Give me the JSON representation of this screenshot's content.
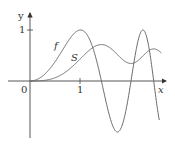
{
  "chart_data": {
    "type": "line",
    "title": "",
    "xlabel": "x",
    "ylabel": "y",
    "x_ticks": [
      {
        "value": 0,
        "label": "0"
      },
      {
        "value": 1,
        "label": "1"
      }
    ],
    "y_ticks": [
      {
        "value": 1,
        "label": "1"
      }
    ],
    "xlim": [
      -0.6,
      2.7
    ],
    "ylim": [
      -1.2,
      1.4
    ],
    "grid": false,
    "legend": "none",
    "series": [
      {
        "name": "f",
        "label": "f",
        "description": "f(x) = sin(pi x^2 / 2)",
        "x_range": [
          0,
          2.56
        ],
        "x": [
          0,
          0.25,
          0.5,
          0.75,
          1.0,
          1.25,
          1.5,
          1.732,
          2.0,
          2.236,
          2.4,
          2.56
        ],
        "values": [
          0,
          0.098,
          0.383,
          0.773,
          1.0,
          0.634,
          -0.383,
          -1.0,
          0.0,
          1.0,
          0.48,
          -0.76
        ]
      },
      {
        "name": "S",
        "label": "S",
        "description": "S(x) = integral from 0 to x of sin(pi t^2 / 2) dt",
        "x_range": [
          0,
          2.6
        ],
        "x": [
          0,
          0.25,
          0.5,
          0.75,
          1.0,
          1.25,
          1.5,
          1.732,
          2.0,
          2.236,
          2.4,
          2.6
        ],
        "values": [
          0,
          0.008,
          0.065,
          0.209,
          0.438,
          0.67,
          0.697,
          0.549,
          0.343,
          0.553,
          0.62,
          0.55
        ]
      }
    ],
    "annotations": [
      {
        "text": "f",
        "near_series": "f"
      },
      {
        "text": "S",
        "near_series": "S"
      }
    ],
    "colors": {
      "curve": "#6b6b6b",
      "axis": "#333333"
    }
  },
  "labels": {
    "y_axis": "y",
    "x_axis": "x",
    "origin": "0",
    "x_tick_1": "1",
    "y_tick_1": "1",
    "f_label": "f",
    "s_label": "S"
  }
}
